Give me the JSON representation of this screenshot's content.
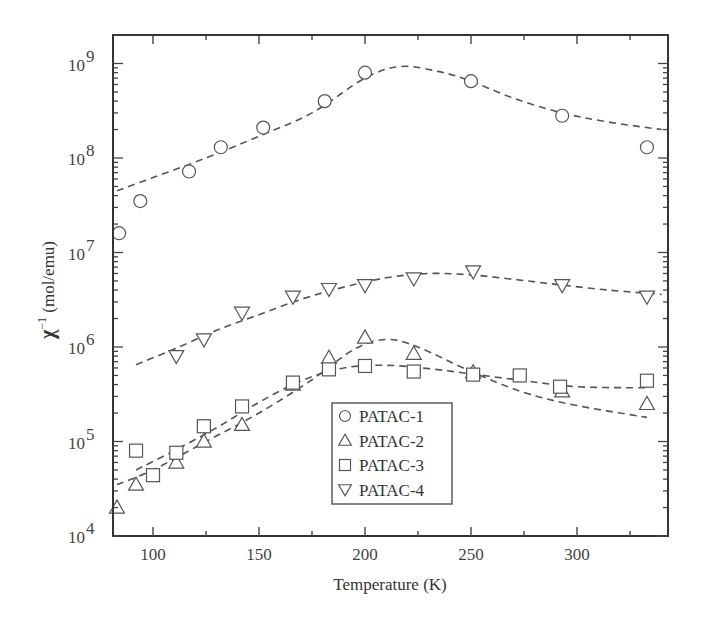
{
  "chart_data": {
    "type": "scatter",
    "title": "",
    "xlabel": "Temperature (K)",
    "ylabel": "χ⁻¹ (mol/emu)",
    "xscale": "linear",
    "yscale": "log",
    "xlim": [
      80.5,
      345
    ],
    "ylim": [
      10000,
      2000000000
    ],
    "xticks": [
      100,
      150,
      200,
      250,
      300
    ],
    "yticks": [
      10000,
      100000,
      1000000,
      10000000,
      100000000,
      1000000000
    ],
    "ytick_labels": [
      "10",
      "10",
      "10",
      "10",
      "10",
      "10"
    ],
    "ytick_exponents": [
      "4",
      "5",
      "6",
      "7",
      "8",
      "9"
    ],
    "grid": false,
    "legend_position": "lower center (inside)",
    "series": [
      {
        "name": "PATAC-1",
        "marker": "circle",
        "x": [
          84,
          94,
          117,
          132,
          152,
          181,
          200,
          250,
          293,
          333
        ],
        "y": [
          16000000,
          35000000,
          72000000,
          130000000,
          210000000,
          400000000,
          800000000,
          650000000,
          280000000,
          130000000
        ],
        "fit": {
          "x": [
            83,
            100,
            125,
            150,
            175,
            200,
            217,
            235,
            250,
            270,
            293,
            315,
            340
          ],
          "y": [
            45000000,
            62000000,
            100000000,
            170000000,
            300000000,
            700000000,
            930000000,
            820000000,
            650000000,
            430000000,
            300000000,
            240000000,
            200000000
          ]
        }
      },
      {
        "name": "PATAC-2",
        "marker": "triangle-up",
        "x": [
          83,
          92,
          111,
          124,
          142,
          166,
          183,
          200,
          223,
          251,
          293,
          333
        ],
        "y": [
          20000,
          35000,
          60000,
          100000,
          150000,
          400000,
          770000,
          1260000,
          850000,
          540000,
          340000,
          250000
        ],
        "fit": {
          "x": [
            83,
            100,
            125,
            150,
            175,
            195,
            210,
            225,
            250,
            275,
            300,
            333
          ],
          "y": [
            35000,
            50000,
            100000,
            200000,
            450000,
            950000,
            1200000,
            1000000,
            550000,
            330000,
            240000,
            180000
          ]
        }
      },
      {
        "name": "PATAC-3",
        "marker": "square",
        "x": [
          92,
          100,
          111,
          124,
          142,
          166,
          183,
          200,
          223,
          251,
          273,
          292,
          333
        ],
        "y": [
          80000,
          44000,
          76000,
          145000,
          235000,
          420000,
          580000,
          630000,
          550000,
          510000,
          500000,
          380000,
          440000
        ],
        "fit": {
          "x": [
            92,
            110,
            130,
            150,
            170,
            190,
            210,
            230,
            250,
            275,
            300,
            333
          ],
          "y": [
            50000,
            80000,
            140000,
            260000,
            440000,
            600000,
            640000,
            590000,
            520000,
            440000,
            380000,
            370000
          ]
        }
      },
      {
        "name": "PATAC-4",
        "marker": "triangle-down",
        "x": [
          111,
          124,
          142,
          166,
          183,
          200,
          223,
          251,
          293,
          333
        ],
        "y": [
          800000,
          1200000,
          2300000,
          3400000,
          4100000,
          4500000,
          5300000,
          6300000,
          4500000,
          3400000
        ],
        "fit": {
          "x": [
            92,
            110,
            130,
            150,
            170,
            190,
            210,
            230,
            250,
            270,
            290,
            315,
            340
          ],
          "y": [
            650000,
            950000,
            1500000,
            2200000,
            3200000,
            4300000,
            5400000,
            6000000,
            5800000,
            5200000,
            4600000,
            4000000,
            3600000
          ]
        }
      }
    ]
  }
}
